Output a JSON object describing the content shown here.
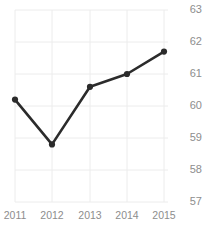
{
  "chart_data": {
    "type": "line",
    "title": "Freedom Trend",
    "xlabel": "",
    "ylabel": "",
    "categories": [
      "2011",
      "2012",
      "2013",
      "2014",
      "2015"
    ],
    "x": [
      2011,
      2012,
      2013,
      2014,
      2015
    ],
    "values": [
      60.2,
      58.8,
      60.6,
      61.0,
      61.7
    ],
    "series": [
      {
        "name": "Freedom Trend",
        "values": [
          60.2,
          58.8,
          60.6,
          61.0,
          61.7
        ]
      }
    ],
    "ylim": [
      56.5,
      63.2
    ],
    "yticks": [
      63,
      62,
      61,
      60,
      59,
      58,
      57
    ],
    "ytick_labels": [
      "63",
      "62",
      "61",
      "60",
      "59",
      "58",
      "57"
    ],
    "xtick_labels": [
      "2011",
      "2012",
      "2013",
      "2014",
      "2015"
    ],
    "grid": true,
    "grid_color": "#ececec",
    "legend": false,
    "legend_position": "none",
    "line_color": "#2b2b2b",
    "marker": "circle",
    "marker_color": "#2b2b2b",
    "axis_label_color": "#8d8d8d",
    "y_axis_side": "right",
    "background": "#ffffff"
  }
}
